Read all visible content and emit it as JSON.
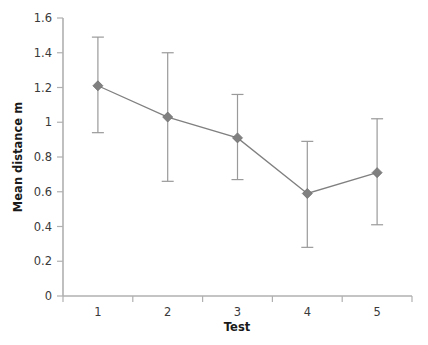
{
  "chart_data": {
    "type": "line",
    "title": "",
    "subtitle": "",
    "xlabel": "Test",
    "ylabel": "Mean distance m",
    "categories": [
      "1",
      "2",
      "3",
      "4",
      "5"
    ],
    "x": [
      1,
      2,
      3,
      4,
      5
    ],
    "values": [
      1.21,
      1.03,
      0.91,
      0.59,
      0.71
    ],
    "error_low": [
      0.94,
      0.66,
      0.67,
      0.28,
      0.41
    ],
    "error_high": [
      1.49,
      1.4,
      1.16,
      0.89,
      1.02
    ],
    "series": [
      {
        "name": "Mean distance",
        "values": [
          1.21,
          1.03,
          0.91,
          0.59,
          0.71
        ],
        "error_low": [
          0.94,
          0.66,
          0.67,
          0.28,
          0.41
        ],
        "error_high": [
          1.49,
          1.4,
          1.16,
          0.89,
          1.02
        ]
      }
    ],
    "ylim": [
      0,
      1.6
    ],
    "yticks": [
      "0",
      "0.2",
      "0.4",
      "0.6",
      "0.8",
      "1",
      "1.2",
      "1.4",
      "1.6"
    ],
    "ytick_values": [
      0,
      0.2,
      0.4,
      0.6,
      0.8,
      1.0,
      1.2,
      1.4,
      1.6
    ],
    "xticks": [
      "1",
      "2",
      "3",
      "4",
      "5"
    ],
    "grid": false,
    "legend": false,
    "legend_position": "none",
    "marker_shape": "diamond",
    "colors": {
      "series_line": "#808080",
      "marker": "#808080",
      "error_bar": "#9a9a9a",
      "axis": "#b0b0b0",
      "text": "#3a3a3a",
      "background": "#ffffff"
    }
  }
}
